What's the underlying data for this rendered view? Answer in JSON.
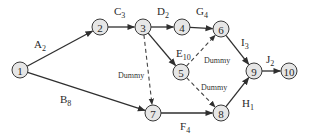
{
  "diagram": {
    "type": "activity-on-arrow network",
    "node_radius": 8,
    "nodes": [
      {
        "id": "1",
        "label": "1",
        "x": 20,
        "y": 70
      },
      {
        "id": "2",
        "label": "2",
        "x": 100,
        "y": 27
      },
      {
        "id": "3",
        "label": "3",
        "x": 143,
        "y": 27
      },
      {
        "id": "4",
        "label": "4",
        "x": 182,
        "y": 27
      },
      {
        "id": "5",
        "label": "5",
        "x": 181,
        "y": 72
      },
      {
        "id": "6",
        "label": "6",
        "x": 221,
        "y": 29
      },
      {
        "id": "7",
        "label": "7",
        "x": 153,
        "y": 113
      },
      {
        "id": "8",
        "label": "8",
        "x": 221,
        "y": 113
      },
      {
        "id": "9",
        "label": "9",
        "x": 254,
        "y": 71
      },
      {
        "id": "10",
        "label": "10",
        "x": 289,
        "y": 71
      }
    ],
    "edges": [
      {
        "from": "1",
        "to": "2",
        "activity": "A",
        "duration": "2",
        "dashed": false,
        "lx": 34,
        "ly": 48
      },
      {
        "from": "1",
        "to": "7",
        "activity": "B",
        "duration": "8",
        "dashed": false,
        "lx": 60,
        "ly": 103
      },
      {
        "from": "2",
        "to": "3",
        "activity": "C",
        "duration": "3",
        "dashed": false,
        "lx": 114,
        "ly": 15
      },
      {
        "from": "3",
        "to": "4",
        "activity": "D",
        "duration": "2",
        "dashed": false,
        "lx": 157,
        "ly": 15
      },
      {
        "from": "4",
        "to": "6",
        "activity": "G",
        "duration": "4",
        "dashed": false,
        "lx": 196,
        "ly": 15
      },
      {
        "from": "3",
        "to": "5",
        "activity": "E",
        "duration": "10",
        "dashed": false,
        "lx": 176,
        "ly": 57
      },
      {
        "from": "6",
        "to": "9",
        "activity": "I",
        "duration": "3",
        "dashed": false,
        "lx": 241,
        "ly": 46
      },
      {
        "from": "9",
        "to": "10",
        "activity": "J",
        "duration": "2",
        "dashed": false,
        "lx": 266,
        "ly": 63
      },
      {
        "from": "7",
        "to": "8",
        "activity": "F",
        "duration": "4",
        "dashed": false,
        "lx": 180,
        "ly": 130
      },
      {
        "from": "8",
        "to": "9",
        "activity": "H",
        "duration": "1",
        "dashed": false,
        "lx": 242,
        "ly": 107
      },
      {
        "from": "3",
        "to": "7",
        "activity": "Dummy",
        "duration": "",
        "dashed": true,
        "lx": 118,
        "ly": 78
      },
      {
        "from": "5",
        "to": "6",
        "activity": "Dummy",
        "duration": "",
        "dashed": true,
        "lx": 204,
        "ly": 63
      },
      {
        "from": "5",
        "to": "8",
        "activity": "Dummy",
        "duration": "",
        "dashed": true,
        "lx": 201,
        "ly": 90
      }
    ]
  }
}
